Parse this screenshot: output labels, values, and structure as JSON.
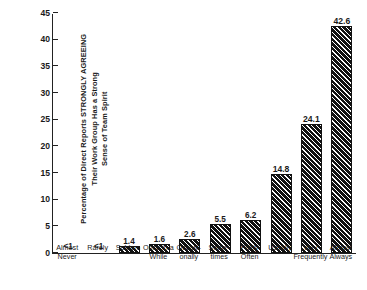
{
  "chart_data": {
    "type": "bar",
    "title": "",
    "subtitle": "",
    "xlabel": "",
    "ylabel_lines": [
      "Percentage of Direct Reports  STRONGLY AGREEING",
      "Their Work Group Has a Strong",
      "Sense of Team Spirit"
    ],
    "ylim": [
      0,
      45
    ],
    "yticks": [
      0,
      5,
      10,
      15,
      20,
      25,
      30,
      35,
      40,
      45
    ],
    "ytick_labels": [
      "0",
      "5",
      "10",
      "15",
      "20",
      "25",
      "30",
      "35",
      "40",
      "45"
    ],
    "grid": false,
    "legend": false,
    "categories": [
      "Almost Never",
      "Rarely",
      "Seldom",
      "Once in a While",
      "Occasionally",
      "Sometimes",
      "Fairly Often",
      "Usually",
      "Very Frequently",
      "Almost Always"
    ],
    "category_label_lines": [
      [
        "Almost",
        "Never"
      ],
      [
        "Rarely"
      ],
      [
        "Seldom"
      ],
      [
        "Once in a",
        "While"
      ],
      [
        "Occasi-",
        "onally"
      ],
      [
        "Some-",
        "times"
      ],
      [
        "Fairly",
        "Often"
      ],
      [
        "Usually"
      ],
      [
        "Very",
        "Frequently"
      ],
      [
        "Almost",
        "Always"
      ]
    ],
    "values": [
      0.5,
      0.5,
      1.4,
      1.6,
      2.6,
      5.5,
      6.2,
      14.8,
      24.1,
      42.6
    ],
    "value_labels": [
      "<1",
      "<1",
      "1.4",
      "1.6",
      "2.6",
      "5.5",
      "6.2",
      "14.8",
      "24.1",
      "42.6"
    ],
    "bar_color": "#111111",
    "bar_pattern": "diagonal-hatch",
    "axis_color": "#222222",
    "background": "#ffffff"
  }
}
